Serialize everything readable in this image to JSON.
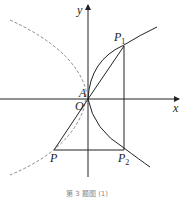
{
  "figure": {
    "axes": {
      "x_label": "x",
      "y_label": "y",
      "origin_label": "O"
    },
    "points": [
      {
        "name": "A",
        "label": "A"
      },
      {
        "name": "P1",
        "label": "P",
        "subscript": "1"
      },
      {
        "name": "P2",
        "label": "P",
        "subscript": "2"
      },
      {
        "name": "P",
        "label": "P"
      }
    ],
    "curves": [
      {
        "name": "solid-parabola",
        "style": "solid",
        "description": "upper branch through A and P1, lower branch through A and P2"
      },
      {
        "name": "dashed-parabola",
        "style": "dashed",
        "description": "reflected parabola on left through A and P"
      }
    ],
    "segments": [
      "O-P1",
      "O-P",
      "P-P2",
      "P1-P2 (vertical)"
    ],
    "caption": "第 3 题图 (1)"
  }
}
